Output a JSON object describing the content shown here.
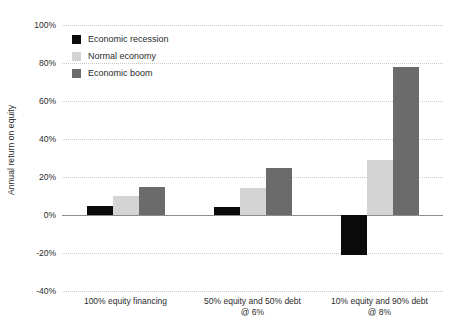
{
  "chart_data": {
    "type": "bar",
    "title": "",
    "subtitle": "",
    "xlabel": "",
    "ylabel": "Annual return on equity",
    "ylim": [
      -40,
      100
    ],
    "ytick_labels": [
      "100%",
      "80%",
      "60%",
      "40%",
      "20%",
      "0%",
      "-20%",
      "-40%"
    ],
    "ytick_values": [
      100,
      80,
      60,
      40,
      20,
      0,
      -20,
      -40
    ],
    "grid": true,
    "legend_position": "top-left",
    "value_unit": "percent",
    "categories": [
      "100% equity financing",
      "50% equity and 50% debt @ 6%",
      "10% equity and 90% debt @ 8%"
    ],
    "category_lines": [
      [
        "100% equity financing"
      ],
      [
        "50% equity and 50% debt",
        "@ 6%"
      ],
      [
        "10% equity and 90% debt",
        "@ 8%"
      ]
    ],
    "series": [
      {
        "name": "Economic recession",
        "color": "#0b0b0b",
        "values": [
          5,
          4,
          -21
        ]
      },
      {
        "name": "Normal economy",
        "color": "#d4d4d4",
        "values": [
          10,
          14,
          29
        ]
      },
      {
        "name": "Economic boom",
        "color": "#6b6b6b",
        "values": [
          15,
          25,
          78
        ]
      }
    ]
  },
  "legend": {
    "items": [
      {
        "label": "Economic recession",
        "color": "#0b0b0b",
        "icon": "square-swatch"
      },
      {
        "label": "Normal economy",
        "color": "#d4d4d4",
        "icon": "square-swatch"
      },
      {
        "label": "Economic boom",
        "color": "#6b6b6b",
        "icon": "square-swatch"
      }
    ]
  },
  "axes": {
    "y_title": "Annual return on equity",
    "zero_line_color": "#8d8d8d",
    "gridline_color": "#c9c9c9"
  }
}
